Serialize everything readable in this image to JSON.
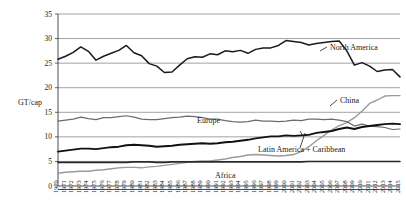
{
  "chart_data": {
    "type": "line",
    "title": "",
    "xlabel": "",
    "ylabel": "GT/cap",
    "ylim": [
      0,
      35
    ],
    "ytick_values": [
      "0",
      "5",
      "10",
      "15",
      "20",
      "25",
      "30",
      "35"
    ],
    "grid": true,
    "legend_position": "inline-annotations",
    "x": [
      1970,
      1971,
      1972,
      1973,
      1974,
      1975,
      1976,
      1977,
      1978,
      1979,
      1980,
      1981,
      1982,
      1983,
      1984,
      1985,
      1986,
      1987,
      1988,
      1989,
      1990,
      1991,
      1992,
      1993,
      1994,
      1995,
      1996,
      1997,
      1998,
      1999,
      2000,
      2001,
      2002,
      2003,
      2004,
      2005,
      2006,
      2007,
      2008,
      2009,
      2010,
      2011,
      2012,
      2013,
      2014,
      2015
    ],
    "xtick_labels": [
      "1970",
      "1971",
      "1972",
      "1973",
      "1974",
      "1975",
      "1976",
      "1977",
      "1978",
      "1979",
      "1980",
      "1981",
      "1982",
      "1983",
      "1984",
      "1985",
      "1986",
      "1987",
      "1988",
      "1989",
      "1990",
      "1991",
      "1992",
      "1993",
      "1994",
      "1995",
      "1996",
      "1997",
      "1998",
      "1999",
      "2000",
      "2001",
      "2002",
      "2003",
      "2004",
      "2005",
      "2006",
      "2007",
      "2008",
      "2009",
      "2010",
      "2011",
      "2012",
      "2013",
      "2014",
      "2015"
    ],
    "series": [
      {
        "name": "North America",
        "label": "North America",
        "color": "#1a1a1a",
        "width": 1.5,
        "label_x": 330,
        "label_y": 50,
        "values": [
          25.8,
          26.4,
          27.2,
          28.3,
          27.4,
          25.6,
          26.4,
          27.0,
          27.6,
          28.6,
          27.1,
          26.5,
          24.9,
          24.4,
          23.1,
          23.2,
          24.6,
          25.9,
          26.3,
          26.2,
          26.9,
          26.7,
          27.5,
          27.3,
          27.6,
          27.0,
          27.8,
          28.1,
          28.1,
          28.6,
          29.6,
          29.4,
          29.2,
          28.7,
          29.0,
          29.2,
          29.4,
          29.5,
          27.5,
          24.6,
          25.1,
          24.4,
          23.3,
          23.6,
          23.7,
          22.2
        ]
      },
      {
        "name": "China",
        "label": "China",
        "color": "#9a9a9a",
        "width": 1.4,
        "label_x": 340,
        "label_y": 103,
        "values": [
          2.6,
          2.8,
          2.9,
          3.0,
          3.0,
          3.2,
          3.3,
          3.5,
          3.7,
          3.8,
          3.8,
          3.7,
          3.9,
          4.0,
          4.2,
          4.4,
          4.6,
          4.8,
          5.0,
          5.1,
          5.1,
          5.3,
          5.5,
          5.8,
          6.0,
          6.3,
          6.4,
          6.3,
          6.2,
          6.1,
          6.2,
          6.4,
          7.0,
          8.0,
          9.2,
          10.3,
          11.4,
          12.3,
          12.9,
          13.9,
          15.2,
          16.8,
          17.5,
          18.3,
          18.4,
          18.4
        ]
      },
      {
        "name": "Europe",
        "label": "Europe",
        "color": "#6b6b6b",
        "width": 1.2,
        "label_x": 197,
        "label_y": 123,
        "values": [
          13.2,
          13.4,
          13.6,
          14.0,
          13.7,
          13.5,
          13.9,
          13.9,
          14.1,
          14.3,
          14.0,
          13.6,
          13.5,
          13.5,
          13.7,
          13.9,
          14.0,
          14.2,
          14.1,
          13.9,
          13.6,
          13.6,
          13.3,
          13.1,
          13.0,
          13.1,
          13.4,
          13.2,
          13.2,
          13.1,
          13.2,
          13.4,
          13.3,
          13.6,
          13.6,
          13.5,
          13.6,
          13.4,
          13.1,
          12.2,
          12.6,
          12.2,
          12.1,
          11.9,
          11.5,
          11.6
        ]
      },
      {
        "name": "Latin America + Caribbean",
        "label": "Latin America + Caribbean",
        "color": "#111111",
        "width": 1.9,
        "label_x": 258,
        "label_y": 152,
        "values": [
          7.0,
          7.2,
          7.4,
          7.6,
          7.6,
          7.5,
          7.7,
          7.9,
          8.0,
          8.3,
          8.4,
          8.3,
          8.2,
          8.0,
          8.1,
          8.2,
          8.4,
          8.5,
          8.6,
          8.7,
          8.6,
          8.7,
          8.9,
          9.0,
          9.2,
          9.4,
          9.7,
          9.9,
          10.1,
          10.1,
          10.3,
          10.2,
          10.3,
          10.4,
          10.8,
          11.0,
          11.2,
          11.6,
          11.9,
          11.6,
          12.0,
          12.2,
          12.4,
          12.6,
          12.7,
          12.6
        ]
      },
      {
        "name": "Africa",
        "label": "Africa",
        "color": "#2a2a2a",
        "width": 1.6,
        "label_x": 215,
        "label_y": 178,
        "values": [
          4.8,
          4.8,
          4.8,
          4.8,
          4.8,
          4.8,
          4.8,
          4.8,
          4.8,
          4.8,
          4.9,
          4.9,
          4.9,
          4.8,
          4.8,
          4.9,
          4.9,
          4.9,
          4.9,
          4.9,
          4.9,
          4.9,
          4.9,
          4.9,
          4.9,
          4.9,
          4.9,
          4.9,
          4.9,
          4.9,
          4.9,
          4.9,
          4.9,
          5.0,
          5.0,
          5.0,
          5.0,
          5.0,
          5.0,
          5.0,
          5.0,
          5.0,
          5.0,
          5.0,
          5.0,
          5.0
        ]
      }
    ]
  }
}
